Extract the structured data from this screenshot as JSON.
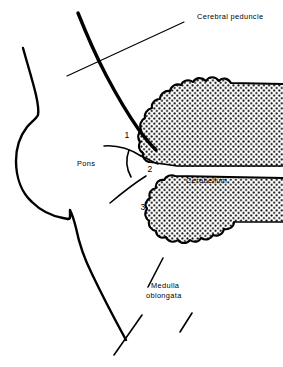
{
  "figure": {
    "background_color": "#ffffff",
    "ink_color": "#000000"
  },
  "labels": {
    "cerebral_peduncle": "Cerebral peduncle",
    "pons": "Pons",
    "cerebellum": "Cerebellum",
    "medulla_line1": "Medulla",
    "medulla_line2": "oblongata"
  },
  "numbered_callouts": [
    {
      "id": "1",
      "text": "1"
    },
    {
      "id": "2",
      "text": "2"
    },
    {
      "id": "3",
      "text": "3"
    }
  ]
}
